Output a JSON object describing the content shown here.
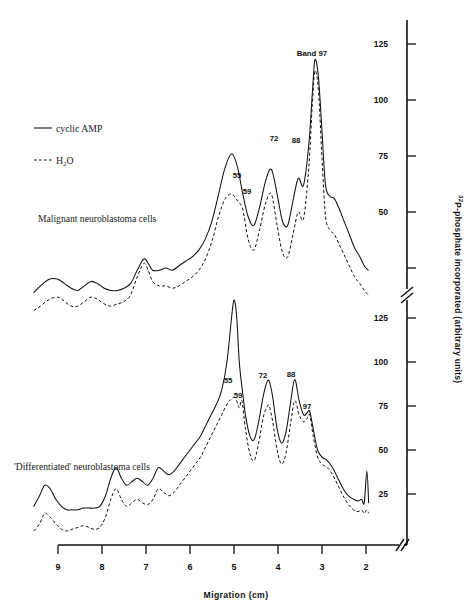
{
  "figure": {
    "x_axis": {
      "title": "Migration (cm)",
      "ticks": [
        "9",
        "8",
        "7",
        "6",
        "5",
        "4",
        "3",
        "2"
      ],
      "has_break": true,
      "direction": "decreasing-left-to-right"
    },
    "y_axis": {
      "title_superscript": "32",
      "title": "P-phosphate incorporated (arbitrary units)",
      "ticks_top": [
        "125",
        "100",
        "75",
        "50"
      ],
      "ticks_bottom": [
        "125",
        "100",
        "75",
        "50",
        "25"
      ],
      "has_break": true
    },
    "legend": {
      "items": [
        {
          "label": "cyclic AMP",
          "style": "solid"
        },
        {
          "label": "H",
          "label_sub": "2",
          "label_tail": "O",
          "style": "dashed"
        }
      ]
    },
    "panels": [
      {
        "id": "malignant",
        "title": "Malignant neuroblastoma cells",
        "peak_labels": [
          {
            "text": "55",
            "x": 237,
            "y": 178
          },
          {
            "text": "59",
            "x": 247,
            "y": 194
          },
          {
            "text": "72",
            "x": 274,
            "y": 141
          },
          {
            "text": "88",
            "x": 296,
            "y": 143
          },
          {
            "text": "Band  97",
            "x": 312,
            "y": 56
          }
        ]
      },
      {
        "id": "differentiated",
        "title": "'Differentiated' neuroblastoma cells",
        "peak_labels": [
          {
            "text": "55",
            "x": 228,
            "y": 383
          },
          {
            "text": "59",
            "x": 238,
            "y": 398
          },
          {
            "text": "72",
            "x": 263,
            "y": 378
          },
          {
            "text": "88",
            "x": 291,
            "y": 377
          },
          {
            "text": "97",
            "x": 307,
            "y": 409
          }
        ]
      }
    ]
  },
  "chart_data": {
    "type": "line",
    "xlabel": "Migration (cm)",
    "ylabel": "32P-phosphate incorporated (arbitrary units)",
    "xlim": [
      9.6,
      1.7
    ],
    "x_ticks": [
      9,
      8,
      7,
      6,
      5,
      4,
      3,
      2
    ],
    "grid": false,
    "legend_position": "upper-left",
    "axis_breaks": {
      "x": true,
      "y": true
    },
    "panels": [
      {
        "name": "Malignant neuroblastoma cells",
        "ylim": [
          0,
          135
        ],
        "y_ticks": [
          50,
          75,
          100,
          125
        ],
        "annotated_peaks": [
          {
            "label": "55",
            "migration_cm": 5.05,
            "value_cyclic_amp": 76,
            "value_h2o": 58
          },
          {
            "label": "59",
            "migration_cm": 4.8,
            "value_cyclic_amp": 63,
            "value_h2o": 51
          },
          {
            "label": "72",
            "migration_cm": 4.15,
            "value_cyclic_amp": 69,
            "value_h2o": 58
          },
          {
            "label": "88",
            "migration_cm": 3.6,
            "value_cyclic_amp": 65,
            "value_h2o": 50
          },
          {
            "label": "Band 97",
            "migration_cm": 3.18,
            "value_cyclic_amp": 118,
            "value_h2o": 113
          }
        ],
        "series": [
          {
            "name": "cyclic AMP",
            "style": "solid",
            "x": [
              9.55,
              9.4,
              9.2,
              9.0,
              8.85,
              8.7,
              8.55,
              8.4,
              8.25,
              8.1,
              7.95,
              7.8,
              7.65,
              7.5,
              7.35,
              7.2,
              7.05,
              6.95,
              6.85,
              6.7,
              6.55,
              6.4,
              6.25,
              6.1,
              5.95,
              5.8,
              5.65,
              5.5,
              5.35,
              5.2,
              5.05,
              4.92,
              4.8,
              4.68,
              4.55,
              4.42,
              4.28,
              4.15,
              4.02,
              3.9,
              3.78,
              3.66,
              3.54,
              3.42,
              3.3,
              3.22,
              3.16,
              3.08,
              3.0,
              2.92,
              2.82,
              2.72,
              2.62,
              2.5,
              2.38,
              2.26,
              2.14,
              2.04,
              1.95
            ],
            "y": [
              14,
              17,
              20,
              20,
              18,
              16,
              15,
              17,
              19,
              18,
              16,
              15,
              15,
              16,
              18,
              24,
              29,
              27,
              24,
              24,
              25,
              24,
              26,
              28,
              30,
              33,
              38,
              46,
              58,
              70,
              76,
              70,
              58,
              48,
              44,
              52,
              64,
              69,
              58,
              46,
              44,
              55,
              65,
              62,
              80,
              103,
              118,
              110,
              86,
              62,
              57,
              56,
              52,
              46,
              40,
              34,
              30,
              26,
              24
            ]
          },
          {
            "name": "H2O",
            "style": "dashed",
            "x": [
              9.55,
              9.4,
              9.2,
              9.0,
              8.85,
              8.7,
              8.55,
              8.4,
              8.25,
              8.1,
              7.95,
              7.8,
              7.65,
              7.5,
              7.35,
              7.2,
              7.05,
              6.95,
              6.85,
              6.7,
              6.55,
              6.4,
              6.25,
              6.1,
              5.95,
              5.8,
              5.65,
              5.5,
              5.35,
              5.2,
              5.05,
              4.92,
              4.8,
              4.68,
              4.55,
              4.42,
              4.28,
              4.15,
              4.02,
              3.9,
              3.78,
              3.66,
              3.54,
              3.42,
              3.3,
              3.22,
              3.16,
              3.08,
              3.0,
              2.92,
              2.82,
              2.72,
              2.62,
              2.5,
              2.38,
              2.26,
              2.14,
              2.04,
              1.95
            ],
            "y": [
              6,
              8,
              11,
              12,
              10,
              8,
              8,
              10,
              12,
              11,
              9,
              8,
              9,
              10,
              13,
              21,
              27,
              24,
              19,
              17,
              17,
              16,
              17,
              19,
              21,
              24,
              29,
              37,
              48,
              56,
              58,
              55,
              51,
              38,
              33,
              42,
              54,
              58,
              44,
              32,
              30,
              40,
              50,
              47,
              70,
              98,
              113,
              104,
              74,
              48,
              42,
              40,
              36,
              31,
              26,
              21,
              18,
              15,
              13
            ]
          }
        ]
      },
      {
        "name": "'Differentiated' neuroblastoma cells",
        "ylim": [
          0,
          145
        ],
        "y_ticks": [
          25,
          50,
          75,
          100,
          125
        ],
        "annotated_peaks": [
          {
            "label": "55",
            "migration_cm": 5.0,
            "value_cyclic_amp": 138,
            "value_h2o": 80
          },
          {
            "label": "59",
            "migration_cm": 4.82,
            "value_cyclic_amp": 86,
            "value_h2o": 78
          },
          {
            "label": "72",
            "migration_cm": 4.2,
            "value_cyclic_amp": 89,
            "value_h2o": 75
          },
          {
            "label": "88",
            "migration_cm": 3.62,
            "value_cyclic_amp": 90,
            "value_h2o": 78
          },
          {
            "label": "97",
            "migration_cm": 3.28,
            "value_cyclic_amp": 72,
            "value_h2o": 70
          }
        ],
        "series": [
          {
            "name": "cyclic AMP",
            "style": "solid",
            "x": [
              9.55,
              9.42,
              9.3,
              9.18,
              9.05,
              8.92,
              8.8,
              8.68,
              8.55,
              8.42,
              8.3,
              8.18,
              8.05,
              7.92,
              7.8,
              7.68,
              7.56,
              7.44,
              7.32,
              7.2,
              7.08,
              6.96,
              6.84,
              6.72,
              6.6,
              6.48,
              6.36,
              6.24,
              6.12,
              6.0,
              5.88,
              5.76,
              5.64,
              5.52,
              5.4,
              5.28,
              5.16,
              5.06,
              5.0,
              4.94,
              4.88,
              4.82,
              4.74,
              4.64,
              4.54,
              4.44,
              4.34,
              4.26,
              4.2,
              4.12,
              4.02,
              3.92,
              3.82,
              3.72,
              3.62,
              3.52,
              3.42,
              3.34,
              3.28,
              3.2,
              3.1,
              3.0,
              2.88,
              2.76,
              2.64,
              2.52,
              2.4,
              2.28,
              2.18,
              2.1,
              2.04,
              1.98,
              1.94
            ],
            "y": [
              18,
              24,
              30,
              28,
              22,
              18,
              16,
              16,
              16,
              17,
              17,
              17,
              18,
              24,
              34,
              40,
              34,
              30,
              32,
              34,
              32,
              30,
              34,
              40,
              38,
              36,
              38,
              42,
              46,
              50,
              54,
              58,
              64,
              70,
              76,
              84,
              100,
              124,
              138,
              126,
              100,
              86,
              70,
              58,
              56,
              66,
              80,
              88,
              89,
              80,
              62,
              54,
              60,
              76,
              90,
              78,
              70,
              71,
              72,
              62,
              50,
              46,
              44,
              40,
              34,
              28,
              24,
              22,
              21,
              22,
              20,
              38,
              20
            ]
          },
          {
            "name": "H2O",
            "style": "dashed",
            "x": [
              9.55,
              9.42,
              9.3,
              9.18,
              9.05,
              8.92,
              8.8,
              8.68,
              8.55,
              8.42,
              8.3,
              8.18,
              8.05,
              7.92,
              7.8,
              7.68,
              7.56,
              7.44,
              7.32,
              7.2,
              7.08,
              6.96,
              6.84,
              6.72,
              6.6,
              6.48,
              6.36,
              6.24,
              6.12,
              6.0,
              5.88,
              5.76,
              5.64,
              5.52,
              5.4,
              5.28,
              5.16,
              5.06,
              5.0,
              4.94,
              4.88,
              4.82,
              4.74,
              4.64,
              4.54,
              4.44,
              4.34,
              4.26,
              4.2,
              4.12,
              4.02,
              3.92,
              3.82,
              3.72,
              3.62,
              3.52,
              3.42,
              3.34,
              3.28,
              3.2,
              3.1,
              3.0,
              2.88,
              2.76,
              2.64,
              2.52,
              2.4,
              2.28,
              2.18,
              2.1,
              2.04,
              1.98,
              1.94
            ],
            "y": [
              4,
              8,
              14,
              12,
              8,
              5,
              4,
              5,
              6,
              7,
              6,
              5,
              6,
              12,
              22,
              28,
              22,
              18,
              20,
              22,
              20,
              19,
              22,
              28,
              26,
              24,
              26,
              30,
              34,
              38,
              42,
              46,
              52,
              58,
              64,
              70,
              76,
              79,
              80,
              78,
              74,
              78,
              62,
              48,
              44,
              54,
              68,
              74,
              75,
              66,
              50,
              42,
              48,
              64,
              78,
              70,
              66,
              68,
              70,
              58,
              46,
              42,
              40,
              36,
              30,
              24,
              19,
              16,
              15,
              16,
              14,
              16,
              14
            ]
          }
        ]
      }
    ]
  }
}
